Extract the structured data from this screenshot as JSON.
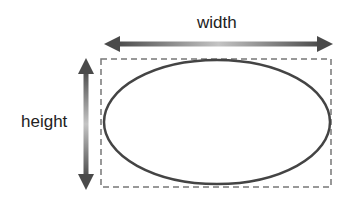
{
  "diagram": {
    "labels": {
      "width": "width",
      "height": "height"
    },
    "shapes": {
      "bounding_box": {
        "style": "dashed",
        "color": "#777777",
        "x": 101,
        "y": 59,
        "w": 230,
        "h": 128
      },
      "ellipse": {
        "color": "#444444",
        "cx": 217,
        "cy": 122,
        "rx": 113,
        "ry": 62
      },
      "width_arrow": {
        "direction": "horizontal",
        "from_x": 104,
        "to_x": 333,
        "y": 44,
        "end_color": "#4a4a4a",
        "mid_color": "#c4c4c4"
      },
      "height_arrow": {
        "direction": "vertical",
        "x": 86,
        "from_y": 58,
        "to_y": 190,
        "end_color": "#4a4a4a",
        "mid_color": "#c4c4c4"
      }
    }
  }
}
